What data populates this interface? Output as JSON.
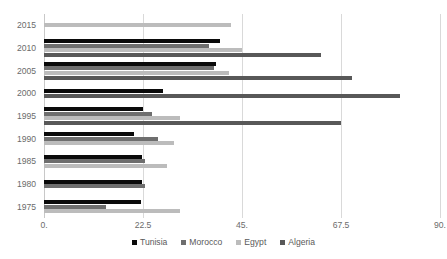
{
  "chart_data": {
    "type": "bar",
    "orientation": "horizontal",
    "title": "",
    "xlabel": "",
    "ylabel": "",
    "xlim": [
      0,
      90
    ],
    "ylim": null,
    "grid": true,
    "legend_position": "bottom",
    "categories": [
      "2015",
      "2010",
      "2005",
      "2000",
      "1995",
      "1990",
      "1985",
      "1980",
      "1975"
    ],
    "xticks": [
      0,
      22.5,
      45,
      67.5,
      90
    ],
    "xtick_labels": [
      "0.",
      "22.5",
      "45.",
      "67.5",
      "90."
    ],
    "series": [
      {
        "name": "Tunisia",
        "color": "#0a0a0a",
        "values": [
          null,
          40.0,
          39.0,
          27.0,
          22.5,
          20.5,
          22.3,
          22.3,
          22.0
        ]
      },
      {
        "name": "Morocco",
        "color": "#6e6e6e",
        "values": [
          null,
          37.5,
          38.7,
          null,
          24.5,
          26.0,
          23.0,
          23.0,
          14.0
        ]
      },
      {
        "name": "Egypt",
        "color": "#bcbcbc",
        "values": [
          42.5,
          45.0,
          42.0,
          null,
          31.0,
          29.5,
          28.0,
          null,
          31.0
        ]
      },
      {
        "name": "Algeria",
        "color": "#585858",
        "values": [
          null,
          63.0,
          70.0,
          81.0,
          67.5,
          null,
          null,
          null,
          null
        ]
      }
    ]
  },
  "legend": {
    "items": [
      {
        "label": "Tunisia",
        "color": "#0a0a0a"
      },
      {
        "label": "Morocco",
        "color": "#6e6e6e"
      },
      {
        "label": "Egypt",
        "color": "#bcbcbc"
      },
      {
        "label": "Algeria",
        "color": "#585858"
      }
    ]
  }
}
